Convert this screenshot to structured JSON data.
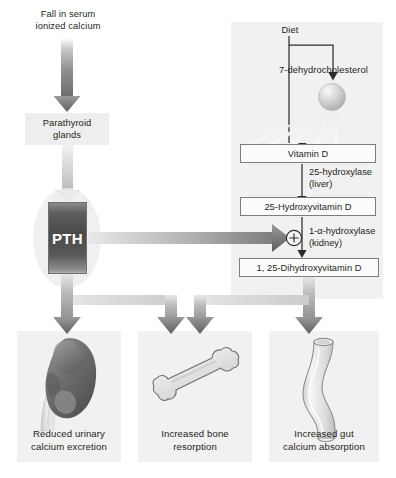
{
  "diagram": {
    "title_nodes": {
      "fall_in_serum": "Fall in serum\nionized calcium",
      "fall_line1": "Fall in serum",
      "fall_line2": "ionized calcium",
      "parathyroid_line1": "Parathyroid",
      "parathyroid_line2": "glands",
      "pth": "PTH"
    },
    "vitamin_d_pathway": {
      "diet": "Diet",
      "dehydrocholesterol": "7-dehydrocholesterol",
      "vitamin_d": "Vitamin D",
      "enzyme_liver_line1": "25-hydroxylase",
      "enzyme_liver_line2": "(liver)",
      "hydroxyvitamin_d": "25-Hydroxyvitamin D",
      "enzyme_kidney_line1": "1-α-hydroxylase",
      "enzyme_kidney_line2": "(kidney)",
      "dihydroxyvitamin_d": "1, 25-Dihydroxyvitamin D",
      "plus_symbol": "⊕"
    },
    "outcomes": [
      {
        "id": "kidney",
        "icon": "kidney-icon",
        "line1": "Reduced urinary",
        "line2": "calcium excretion"
      },
      {
        "id": "bone",
        "icon": "bone-icon",
        "line1": "Increased bone",
        "line2": "resorption"
      },
      {
        "id": "gut",
        "icon": "intestine-icon",
        "line1": "Increased gut",
        "line2": "calcium absorption"
      }
    ],
    "colors": {
      "panel_bg": "#f1f1f1",
      "text": "#231f20",
      "arrow_dark": "#6e6e6e",
      "arrow_light": "#cfcfcf",
      "pth_fill": "#4a4a4a",
      "kidney_fill": "#6b6b6b",
      "box_border": "#7d7d7d",
      "thin_line": "#3a3a3a"
    }
  }
}
